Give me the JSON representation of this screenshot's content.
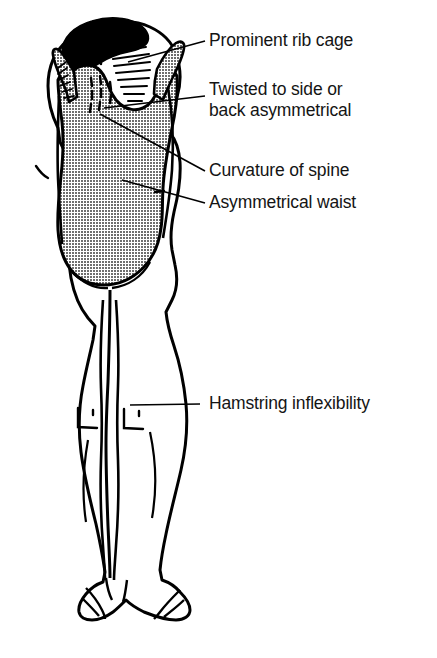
{
  "diagram": {
    "background_color": "#ffffff",
    "line_color": "#000000",
    "leotard_color": "#8f8f8f",
    "hair_color": "#000000",
    "skin_color": "#ffffff"
  },
  "annotations": [
    {
      "id": "prominent-rib-cage",
      "text": "Prominent rib cage",
      "target": "upper-back-rib-hump"
    },
    {
      "id": "twisted-to-side",
      "text": "Twisted to side or",
      "text2": "back asymmetrical",
      "target": "upper-torso"
    },
    {
      "id": "curvature-of-spine",
      "text": "Curvature of spine",
      "target": "spine"
    },
    {
      "id": "asymmetrical-waist",
      "text": "Asymmetrical waist",
      "target": "waist"
    },
    {
      "id": "hamstring-inflexibility",
      "text": "Hamstring inflexibility",
      "target": "back-of-knees"
    }
  ]
}
